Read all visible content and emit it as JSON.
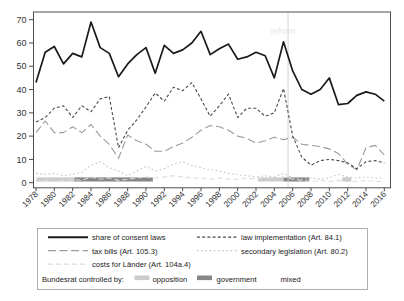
{
  "chart_data": {
    "type": "line",
    "title": "",
    "xlabel": "",
    "ylabel": "",
    "ylim": [
      -2.5,
      71
    ],
    "grid": false,
    "legend_position": "bottom-box",
    "y_ticks": [
      0,
      10,
      20,
      30,
      40,
      50,
      60,
      70
    ],
    "x_ticks": [
      1978,
      1980,
      1982,
      1984,
      1986,
      1988,
      1990,
      1992,
      1994,
      1996,
      1998,
      2000,
      2002,
      2004,
      2006,
      2008,
      2010,
      2012,
      2014,
      2016
    ],
    "years": [
      1978,
      1979,
      1980,
      1981,
      1982,
      1983,
      1984,
      1985,
      1986,
      1987,
      1988,
      1989,
      1990,
      1991,
      1992,
      1993,
      1994,
      1995,
      1996,
      1997,
      1998,
      1999,
      2000,
      2001,
      2002,
      2003,
      2004,
      2005,
      2006,
      2007,
      2008,
      2009,
      2010,
      2011,
      2012,
      2013,
      2014,
      2015,
      2016
    ],
    "series": [
      {
        "name": "share-of-consent-laws",
        "label": "share of consent laws",
        "color": "#1a1a1a",
        "dash": "",
        "width": 1.7,
        "values": [
          43,
          56,
          58.5,
          51,
          55.5,
          54,
          69,
          58,
          55.5,
          45.5,
          51,
          55,
          58,
          47,
          59,
          55.5,
          57,
          60,
          65,
          55,
          57.5,
          59.5,
          53,
          54,
          56,
          54.5,
          45,
          60.5,
          48,
          40,
          38,
          40,
          45,
          33.5,
          34,
          37.5,
          39,
          38,
          35
        ]
      },
      {
        "name": "law-implementation",
        "label": "law implementation (Art. 84.1)",
        "color": "#4a4a4a",
        "dash": "3 2.2",
        "width": 1.1,
        "values": [
          26,
          28,
          32,
          33,
          28,
          33,
          30.5,
          36,
          37,
          15,
          22.5,
          27,
          32.5,
          38.5,
          35,
          41,
          39.5,
          43,
          36,
          28.5,
          33,
          38,
          28,
          32,
          32,
          28.5,
          30,
          40.5,
          20,
          11,
          7.5,
          9.5,
          10,
          9.5,
          8.5,
          6,
          9,
          9.5,
          8.5
        ]
      },
      {
        "name": "tax-bills",
        "label": "tax bills (Art. 105.3)",
        "color": "#9b9b9b",
        "dash": "8 3.5",
        "width": 1.1,
        "values": [
          21.5,
          26.5,
          21.5,
          21.5,
          24,
          21.5,
          25,
          20,
          16.5,
          10.5,
          20.5,
          18,
          16.5,
          13.5,
          13.5,
          15.5,
          17,
          19.5,
          22.5,
          24.5,
          24,
          22.5,
          20,
          19,
          17,
          18,
          19.5,
          18.5,
          19.5,
          16.5,
          16,
          15.5,
          14.5,
          12.5,
          8,
          5.5,
          15,
          16,
          12
        ]
      },
      {
        "name": "secondary-legislation",
        "label": "secondary legislation (Art. 80.2)",
        "color": "#c3c3c3",
        "dash": "1.6 2.6",
        "width": 1.1,
        "values": [
          4,
          3.5,
          4,
          3,
          3.5,
          4.5,
          7.5,
          9,
          6.5,
          5,
          3,
          5,
          7,
          5,
          6,
          8,
          9,
          7.5,
          6.5,
          5.5,
          5,
          4,
          3.5,
          3,
          2.5,
          3,
          2.5,
          4,
          2,
          1.5,
          2,
          1.5,
          2,
          3.5,
          2.5,
          2,
          2.5,
          2,
          2
        ]
      },
      {
        "name": "costs-for-laender",
        "label": "costs for Länder (Art. 104a.4)",
        "color": "#dcdcdc",
        "dash": "5 3",
        "width": 1.1,
        "values": [
          0.5,
          1,
          0.5,
          1,
          1.5,
          1,
          2.5,
          1.5,
          2,
          1,
          1.5,
          2,
          2.5,
          2,
          2.5,
          3,
          2.5,
          2,
          2,
          1.5,
          2,
          1.5,
          1.5,
          2,
          1.5,
          2,
          2,
          2.5,
          1.5,
          1,
          0.5,
          1,
          0.5,
          1,
          0.5,
          0.5,
          1,
          0.5,
          0.5
        ]
      }
    ],
    "reform_line": {
      "x": 2005.5,
      "color": "#cfcfcf",
      "label": "reform",
      "label_color": "#e7e7e7"
    },
    "control_bar": {
      "label": "Bundesrat controlled by:",
      "categories": [
        {
          "name": "opposition",
          "label": "opposition",
          "color": "#cbcbcb"
        },
        {
          "name": "government",
          "label": "government",
          "color": "#878787"
        },
        {
          "name": "mixed",
          "label": "mixed",
          "color": "#ffffff"
        }
      ],
      "segments": [
        {
          "category": "opposition",
          "from": 1978.05,
          "to": 1982.2
        },
        {
          "category": "government",
          "from": 1982.2,
          "to": 1990.75
        },
        {
          "category": "opposition",
          "from": 2002.2,
          "to": 2005.0
        },
        {
          "category": "government",
          "from": 2005.0,
          "to": 2007.8
        },
        {
          "category": "opposition",
          "from": 2011.4,
          "to": 2012.4
        }
      ]
    }
  }
}
